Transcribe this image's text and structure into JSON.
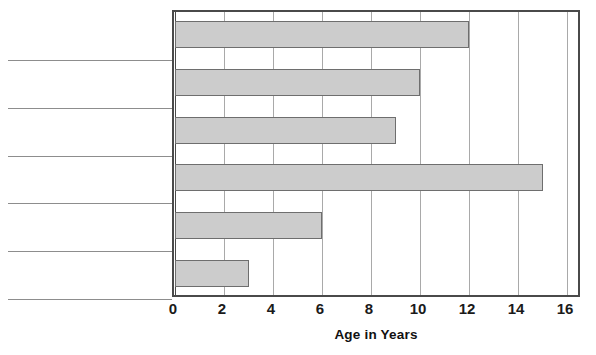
{
  "chart_data": {
    "type": "bar",
    "orientation": "horizontal",
    "title": "",
    "xlabel": "Age in Years",
    "ylabel": "",
    "categories": [
      "",
      "",
      "",
      "",
      "",
      ""
    ],
    "values": [
      12,
      10,
      9,
      15,
      6,
      3
    ],
    "xlim": [
      0,
      16.65
    ],
    "ylim": [
      0,
      6
    ],
    "xticks": [
      0,
      2,
      4,
      6,
      8,
      10,
      12,
      14,
      16
    ],
    "xtick_labels": [
      "0",
      "2",
      "4",
      "6",
      "8",
      "10",
      "12",
      "14",
      "16"
    ],
    "grid": "vertical",
    "legend": "none",
    "bar_fill_color": "#cccccc",
    "bar_edge_color": "#6e6e6e",
    "gridline_color": "#a9a9a9",
    "axis_color": "#4a4a4a"
  },
  "axis": {
    "x_title": "Age in Years",
    "ticks": [
      {
        "label": "0",
        "value": 0
      },
      {
        "label": "2",
        "value": 2
      },
      {
        "label": "4",
        "value": 4
      },
      {
        "label": "6",
        "value": 6
      },
      {
        "label": "8",
        "value": 8
      },
      {
        "label": "10",
        "value": 10
      },
      {
        "label": "12",
        "value": 12
      },
      {
        "label": "14",
        "value": 14
      },
      {
        "label": "16",
        "value": 16
      }
    ]
  },
  "answer_lines": [
    {
      "index": 1,
      "text": ""
    },
    {
      "index": 2,
      "text": ""
    },
    {
      "index": 3,
      "text": ""
    },
    {
      "index": 4,
      "text": ""
    },
    {
      "index": 5,
      "text": ""
    },
    {
      "index": 6,
      "text": ""
    }
  ],
  "geometry": {
    "plot_left_px": 172,
    "plot_top_px": 10,
    "plot_width_px": 408,
    "plot_height_px": 287,
    "x_zero_px": 1,
    "px_per_unit": 24.5,
    "bar_height_px": 27,
    "row_height_px": 47.8,
    "line_left_px": 8,
    "line_width_px": 164
  }
}
